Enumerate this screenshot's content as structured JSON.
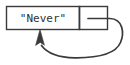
{
  "diagram": {
    "type": "cons-cell-self-reference",
    "background_color": "#ffffff",
    "stroke_color": "#3a3a3a",
    "text_color": "#333333",
    "cons_cell": {
      "car": {
        "label": "\"Never\"",
        "x": 6,
        "y": 6,
        "width": 74,
        "height": 24
      },
      "cdr": {
        "label": "",
        "x": 80,
        "y": 6,
        "width": 28,
        "height": 24
      }
    },
    "pointer": {
      "name": "self-pointer-arrow",
      "from": "cdr-cell",
      "to": "car-cell-bottom",
      "path": "M 88 18 L 110 18 C 124 18 124 34 121 43 C 117 53 100 58 76 58 C 60 58 48 54 42 46",
      "arrowhead_tip_x": 40,
      "arrowhead_tip_y": 30,
      "stroke_width": 1.6
    }
  }
}
